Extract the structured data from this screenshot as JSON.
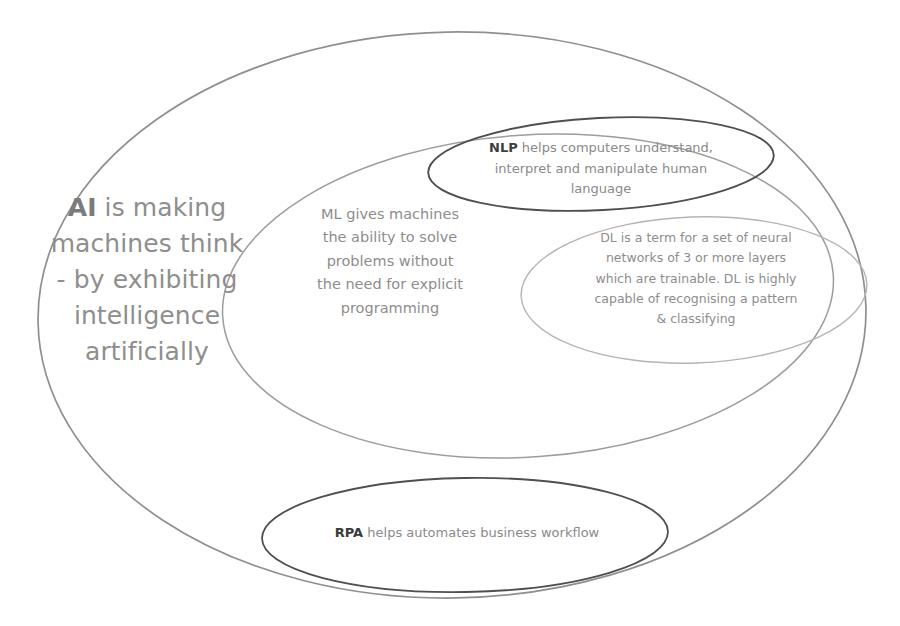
{
  "diagram": {
    "type": "venn-euler",
    "background_color": "#ffffff",
    "sets": [
      {
        "id": "ai",
        "abbreviation": "AI",
        "full_text": "AI is making machines think - by exhibiting intelligence artificially",
        "lines": [
          "AI is making",
          "machines think",
          "- by  exhibiting",
          "intelligence",
          "artificially"
        ],
        "stroke_color": "#8f8f8f",
        "text_color": "#8e8e8e",
        "geometry": {
          "cx": 452,
          "cy": 315,
          "rx": 414,
          "ry": 283
        }
      },
      {
        "id": "ml",
        "abbreviation": "ML",
        "full_text": "ML gives machines the ability to solve problems without the need for explicit programming",
        "lines": [
          "ML gives machines",
          "the ability to solve",
          "problems without",
          "the need for explicit",
          "programming"
        ],
        "stroke_color": "#9a9a9a",
        "text_color": "#8d8d8d",
        "geometry": {
          "cx": 528,
          "cy": 296,
          "rx": 306,
          "ry": 161
        }
      },
      {
        "id": "nlp",
        "abbreviation": "NLP",
        "full_text": "NLP helps computers understand, interpret and manipulate human language",
        "rest_text": " helps computers understand, interpret and manipulate human language",
        "lines": [
          "helps computers understand,",
          "interpret and manipulate human",
          "language"
        ],
        "stroke_color": "#4a4a4a",
        "text_color": "#8a8a8a",
        "geometry": {
          "cx": 600,
          "cy": 164,
          "rx": 172,
          "ry": 46
        }
      },
      {
        "id": "dl",
        "abbreviation": "DL",
        "full_text": "DL is a term for a set of neural networks of 3 or more layers which are trainable. DL is highly capable of recognising a pattern & classifying",
        "lines": [
          "DL is a term for a set of neural",
          "networks of 3 or more layers",
          "which are trainable.  DL is highly",
          "capable of recognising a pattern",
          "& classifying"
        ],
        "stroke_color": "#b0b0b0",
        "text_color": "#8d8d8d",
        "geometry": {
          "cx": 694,
          "cy": 290,
          "rx": 172,
          "ry": 72
        }
      },
      {
        "id": "rpa",
        "abbreviation": "RPA",
        "full_text": "RPA helps automates business workflow",
        "rest_text": " helps automates business workflow",
        "lines": [
          "helps automates business workflow"
        ],
        "stroke_color": "#4a4a4a",
        "text_color": "#8a8a8a",
        "geometry": {
          "cx": 465,
          "cy": 535,
          "rx": 203,
          "ry": 57
        }
      }
    ]
  },
  "ai": {
    "term": "AI",
    "line1_rest": " is making",
    "line2": "machines think",
    "line3": "- by  exhibiting",
    "line4": "intelligence",
    "line5": "artificially"
  },
  "ml": {
    "line1": "ML gives machines",
    "line2": "the ability to solve",
    "line3": "problems without",
    "line4": "the need for explicit",
    "line5": "programming"
  },
  "nlp": {
    "term": "NLP",
    "line1_rest": " helps computers understand,",
    "line2": "interpret and manipulate human",
    "line3": "language"
  },
  "dl": {
    "line1": "DL is a term for a set of neural",
    "line2": "networks of 3 or more layers",
    "line3": "which are trainable.  DL is highly",
    "line4": "capable of recognising a pattern",
    "line5": "& classifying"
  },
  "rpa": {
    "term": "RPA",
    "line1_rest": " helps automates business workflow"
  }
}
